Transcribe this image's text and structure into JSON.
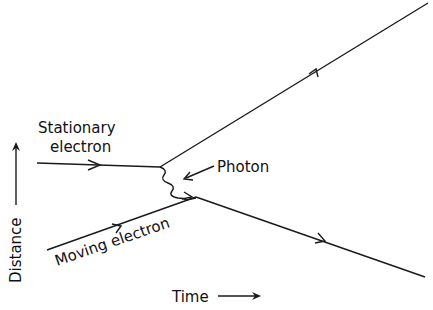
{
  "diagram": {
    "labels": {
      "stationary_line1": "Stationary",
      "stationary_line2": "electron",
      "moving": "Moving electron",
      "photon": "Photon",
      "x_axis": "Time",
      "y_axis": "Distance"
    },
    "colors": {
      "line": "#1a1a1a",
      "background": "#ffffff"
    }
  }
}
